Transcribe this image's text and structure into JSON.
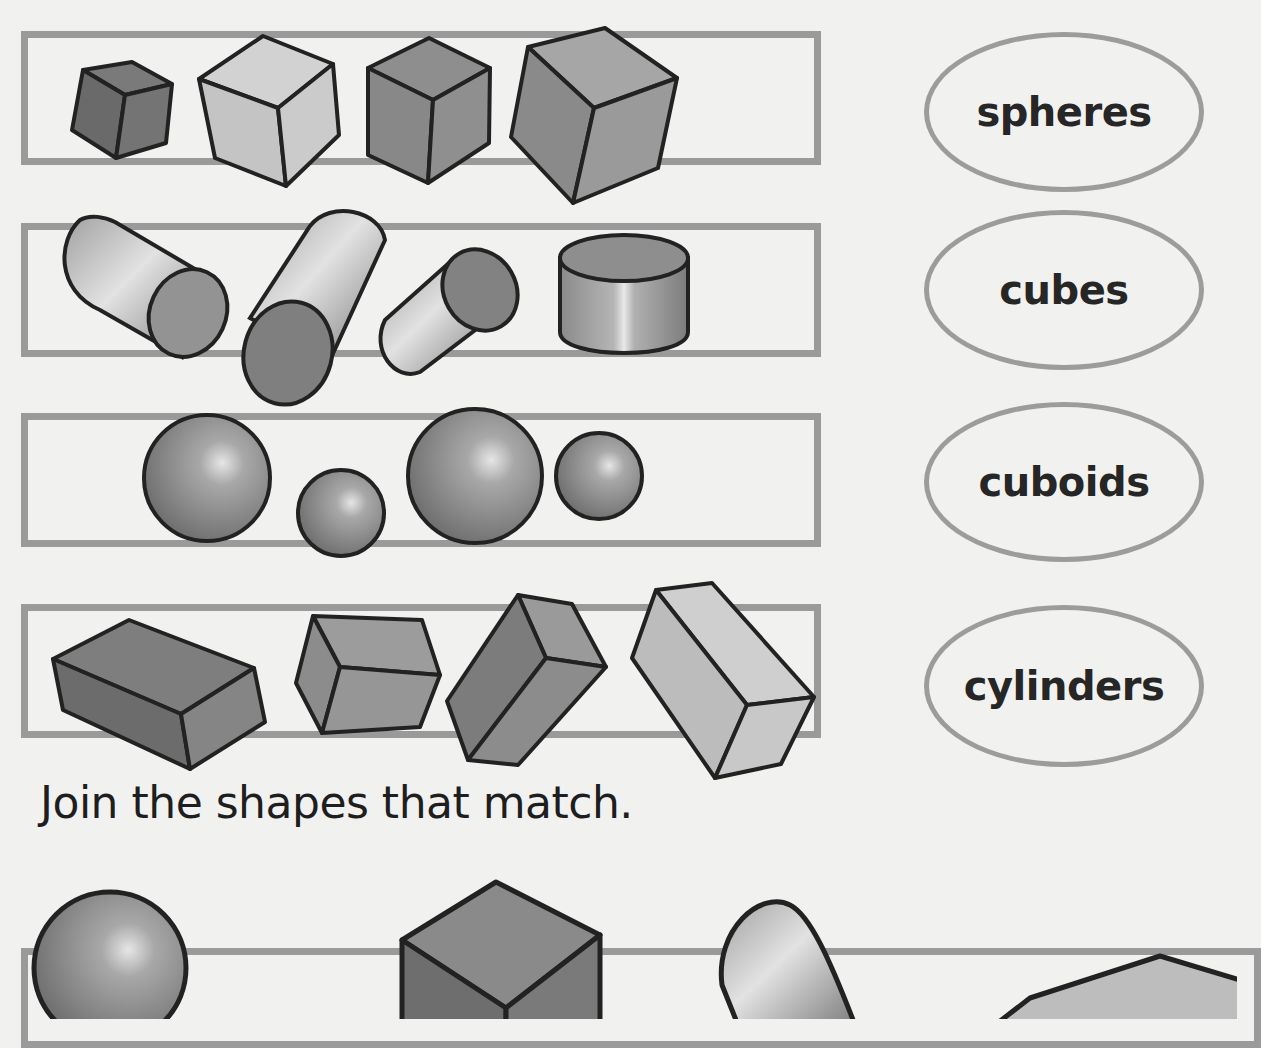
{
  "worksheet": {
    "rows": [
      {
        "id": "cubes-row",
        "shape_type": "cube",
        "count": 4
      },
      {
        "id": "cylinders-row",
        "shape_type": "cylinder",
        "count": 4
      },
      {
        "id": "spheres-row",
        "shape_type": "sphere",
        "count": 4
      },
      {
        "id": "cuboids-row",
        "shape_type": "cuboid",
        "count": 4
      }
    ],
    "labels": [
      {
        "text": "spheres"
      },
      {
        "text": "cubes"
      },
      {
        "text": "cuboids"
      },
      {
        "text": "cylinders"
      }
    ],
    "instruction": "Join the shapes that match.",
    "bottom_row": {
      "shapes": [
        "sphere",
        "cube",
        "cylinder",
        "cuboid"
      ]
    },
    "colors": {
      "frame": "#9a9a9a",
      "outline": "#222222",
      "shape_dark": "#6e6e6e",
      "shape_mid": "#8c8c8c",
      "shape_light": "#c2c2c2",
      "background": "#f1f1f0"
    }
  }
}
